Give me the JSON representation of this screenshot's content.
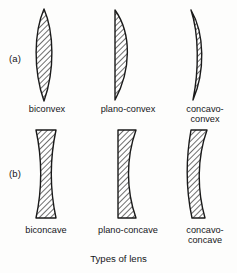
{
  "figure": {
    "caption": "Types of lens",
    "rows": [
      {
        "label": "(a)",
        "group": "converging"
      },
      {
        "label": "(b)",
        "group": "diverging"
      }
    ],
    "colors": {
      "outline": "#1a1a1a",
      "hatch": "#3a3a3a",
      "fill": "#ffffff",
      "background": "#fdfdfc",
      "text": "#15161a"
    },
    "lenses": [
      {
        "id": "biconvex",
        "name": "biconvex",
        "row": "(a)"
      },
      {
        "id": "plano-convex",
        "name": "plano-convex",
        "row": "(a)"
      },
      {
        "id": "concavo-convex",
        "name": "concavo-\nconvex",
        "row": "(a)"
      },
      {
        "id": "biconcave",
        "name": "biconcave",
        "row": "(b)"
      },
      {
        "id": "plano-concave",
        "name": "plano-concave",
        "row": "(b)"
      },
      {
        "id": "concavo-concave",
        "name": "concavo-\nconcave",
        "row": "(b)"
      }
    ]
  }
}
